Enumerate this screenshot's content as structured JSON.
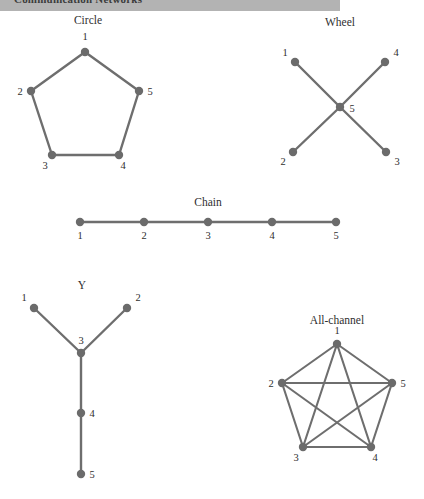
{
  "header": {
    "title": "Communication Networks"
  },
  "diagram_data": {
    "type": "diagram",
    "subject": "Small-group communication network structures",
    "node_radius": 4.2,
    "node_color": "#6b6b6b",
    "edge_color": "#6e6e6e",
    "networks": [
      {
        "name": "circle",
        "label": "Circle",
        "label_pos": {
          "x": 88,
          "y": 24
        },
        "nodes": [
          {
            "id": "1",
            "x": 85,
            "y": 52,
            "label_x": 85,
            "label_y": 40,
            "anchor": "middle"
          },
          {
            "id": "2",
            "x": 31,
            "y": 91,
            "label_x": 20,
            "label_y": 95,
            "anchor": "middle"
          },
          {
            "id": "3",
            "x": 52,
            "y": 155,
            "label_x": 45,
            "label_y": 169,
            "anchor": "middle"
          },
          {
            "id": "4",
            "x": 119,
            "y": 155,
            "label_x": 123,
            "label_y": 169,
            "anchor": "middle"
          },
          {
            "id": "5",
            "x": 139,
            "y": 91,
            "label_x": 150,
            "label_y": 95,
            "anchor": "middle"
          }
        ],
        "edges": [
          [
            "1",
            "2"
          ],
          [
            "2",
            "3"
          ],
          [
            "3",
            "4"
          ],
          [
            "4",
            "5"
          ],
          [
            "5",
            "1"
          ]
        ]
      },
      {
        "name": "wheel",
        "label": "Wheel",
        "label_pos": {
          "x": 340,
          "y": 26
        },
        "nodes": [
          {
            "id": "1",
            "x": 295,
            "y": 62,
            "label_x": 285,
            "label_y": 56,
            "anchor": "middle"
          },
          {
            "id": "2",
            "x": 293,
            "y": 152,
            "label_x": 283,
            "label_y": 165,
            "anchor": "middle"
          },
          {
            "id": "3",
            "x": 386,
            "y": 152,
            "label_x": 397,
            "label_y": 165,
            "anchor": "middle"
          },
          {
            "id": "4",
            "x": 385,
            "y": 62,
            "label_x": 396,
            "label_y": 56,
            "anchor": "middle"
          },
          {
            "id": "5",
            "x": 340,
            "y": 107,
            "label_x": 352,
            "label_y": 112,
            "anchor": "middle"
          }
        ],
        "edges": [
          [
            "1",
            "5"
          ],
          [
            "2",
            "5"
          ],
          [
            "3",
            "5"
          ],
          [
            "4",
            "5"
          ]
        ]
      },
      {
        "name": "chain",
        "label": "Chain",
        "label_pos": {
          "x": 208,
          "y": 206
        },
        "nodes": [
          {
            "id": "1",
            "x": 80,
            "y": 222,
            "label_x": 80,
            "label_y": 239,
            "anchor": "middle"
          },
          {
            "id": "2",
            "x": 144,
            "y": 222,
            "label_x": 144,
            "label_y": 239,
            "anchor": "middle"
          },
          {
            "id": "3",
            "x": 208,
            "y": 222,
            "label_x": 208,
            "label_y": 239,
            "anchor": "middle"
          },
          {
            "id": "4",
            "x": 272,
            "y": 222,
            "label_x": 272,
            "label_y": 239,
            "anchor": "middle"
          },
          {
            "id": "5",
            "x": 336,
            "y": 222,
            "label_x": 336,
            "label_y": 239,
            "anchor": "middle"
          }
        ],
        "edges": [
          [
            "1",
            "2"
          ],
          [
            "2",
            "3"
          ],
          [
            "3",
            "4"
          ],
          [
            "4",
            "5"
          ]
        ]
      },
      {
        "name": "y",
        "label": "Y",
        "label_pos": {
          "x": 82,
          "y": 289
        },
        "nodes": [
          {
            "id": "1",
            "x": 34,
            "y": 308,
            "label_x": 24,
            "label_y": 301,
            "anchor": "middle"
          },
          {
            "id": "2",
            "x": 127,
            "y": 308,
            "label_x": 138,
            "label_y": 301,
            "anchor": "middle"
          },
          {
            "id": "3",
            "x": 81,
            "y": 353,
            "label_x": 81,
            "label_y": 344,
            "anchor": "middle"
          },
          {
            "id": "4",
            "x": 81,
            "y": 413,
            "label_x": 92,
            "label_y": 417,
            "anchor": "middle"
          },
          {
            "id": "5",
            "x": 81,
            "y": 474,
            "label_x": 92,
            "label_y": 478,
            "anchor": "middle"
          }
        ],
        "edges": [
          [
            "1",
            "3"
          ],
          [
            "2",
            "3"
          ],
          [
            "3",
            "4"
          ],
          [
            "4",
            "5"
          ]
        ]
      },
      {
        "name": "all-channel",
        "label": "All-channel",
        "label_pos": {
          "x": 337,
          "y": 324
        },
        "nodes": [
          {
            "id": "1",
            "x": 337,
            "y": 344,
            "label_x": 337,
            "label_y": 334,
            "anchor": "middle"
          },
          {
            "id": "2",
            "x": 282,
            "y": 383,
            "label_x": 271,
            "label_y": 387,
            "anchor": "middle"
          },
          {
            "id": "3",
            "x": 303,
            "y": 447,
            "label_x": 296,
            "label_y": 461,
            "anchor": "middle"
          },
          {
            "id": "4",
            "x": 371,
            "y": 447,
            "label_x": 375,
            "label_y": 461,
            "anchor": "middle"
          },
          {
            "id": "5",
            "x": 392,
            "y": 383,
            "label_x": 403,
            "label_y": 387,
            "anchor": "middle"
          }
        ],
        "edges": [
          [
            "1",
            "2"
          ],
          [
            "2",
            "3"
          ],
          [
            "3",
            "4"
          ],
          [
            "4",
            "5"
          ],
          [
            "5",
            "1"
          ],
          [
            "1",
            "3"
          ],
          [
            "1",
            "4"
          ],
          [
            "2",
            "4"
          ],
          [
            "2",
            "5"
          ],
          [
            "3",
            "5"
          ]
        ]
      }
    ]
  }
}
